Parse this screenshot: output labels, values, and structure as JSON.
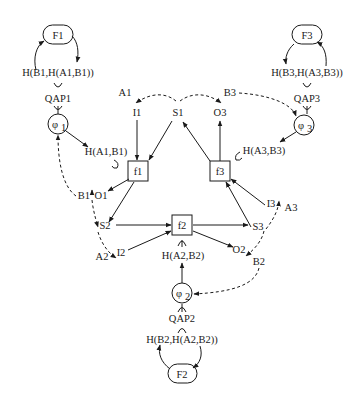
{
  "diagram": {
    "type": "cyclic-agent-interaction-network",
    "colors": {
      "ink": "#1a1a1a",
      "background": "#ffffff"
    },
    "functions": [
      {
        "id": "F1",
        "label": "F1"
      },
      {
        "id": "F2",
        "label": "F2"
      },
      {
        "id": "F3",
        "label": "F3"
      }
    ],
    "hashes": [
      {
        "id": "HB1",
        "label": "H(B1,H(A1,B1))"
      },
      {
        "id": "HB2",
        "label": "H(B2,H(A2,B2))"
      },
      {
        "id": "HB3",
        "label": "H(B3,H(A3,B3))"
      },
      {
        "id": "HA1",
        "label": "H(A1,B1)"
      },
      {
        "id": "HA2",
        "label": "H(A2,B2)"
      },
      {
        "id": "HA3",
        "label": "H(A3,B3)"
      }
    ],
    "qaps": [
      {
        "id": "QAP1",
        "label": "QAP1"
      },
      {
        "id": "QAP2",
        "label": "QAP2"
      },
      {
        "id": "QAP3",
        "label": "QAP3"
      }
    ],
    "phis": [
      {
        "id": "phi1",
        "symbol": "φ",
        "sub": "1"
      },
      {
        "id": "phi2",
        "symbol": "φ",
        "sub": "2"
      },
      {
        "id": "phi3",
        "symbol": "φ",
        "sub": "3"
      }
    ],
    "boxes": [
      {
        "id": "f1",
        "label": "f1"
      },
      {
        "id": "f2",
        "label": "f2"
      },
      {
        "id": "f3",
        "label": "f3"
      }
    ],
    "io": {
      "I1": "I1",
      "S1": "S1",
      "O3": "O3",
      "O1": "O1",
      "S2": "S2",
      "I2": "I2",
      "O2": "O2",
      "S3": "S3",
      "I3": "I3"
    },
    "keys": {
      "A1": "A1",
      "B1": "B1",
      "A2": "A2",
      "B2": "B2",
      "A3": "A3",
      "B3": "B3"
    },
    "edges": [
      {
        "from": "F1",
        "to": "HB1",
        "style": "solid"
      },
      {
        "from": "HB1",
        "to": "F1",
        "style": "solid"
      },
      {
        "from": "F3",
        "to": "HB3",
        "style": "solid"
      },
      {
        "from": "HB3",
        "to": "F3",
        "style": "solid"
      },
      {
        "from": "F2",
        "to": "HB2",
        "style": "solid"
      },
      {
        "from": "HB2",
        "to": "F2",
        "style": "solid"
      },
      {
        "from": "phi1",
        "to": "HA1",
        "style": "solid"
      },
      {
        "from": "phi3",
        "to": "HA3",
        "style": "solid"
      },
      {
        "from": "phi2",
        "to": "HA2",
        "style": "solid"
      },
      {
        "from": "I1",
        "to": "f1",
        "style": "solid"
      },
      {
        "from": "S1",
        "to": "f1",
        "style": "solid"
      },
      {
        "from": "f3",
        "to": "S1",
        "style": "solid"
      },
      {
        "from": "f3",
        "to": "O3",
        "style": "solid"
      },
      {
        "from": "f1",
        "to": "O1",
        "style": "solid"
      },
      {
        "from": "f1",
        "to": "S2",
        "style": "solid"
      },
      {
        "from": "S2",
        "to": "f2",
        "style": "solid"
      },
      {
        "from": "I2",
        "to": "f2",
        "style": "solid"
      },
      {
        "from": "f2",
        "to": "S3",
        "style": "solid"
      },
      {
        "from": "f2",
        "to": "O2",
        "style": "solid"
      },
      {
        "from": "S3",
        "to": "f3",
        "style": "solid"
      },
      {
        "from": "I3",
        "to": "f3",
        "style": "solid"
      },
      {
        "from": "S1",
        "to": "I1",
        "style": "dashed"
      },
      {
        "from": "S1",
        "to": "O3",
        "style": "dashed"
      },
      {
        "from": "B3",
        "to": "phi3",
        "style": "dashed"
      },
      {
        "from": "B1",
        "to": "phi1",
        "style": "dashed"
      },
      {
        "from": "O1",
        "to": "S2",
        "style": "dashed"
      },
      {
        "from": "S2",
        "to": "I2",
        "style": "dashed"
      },
      {
        "from": "S3",
        "to": "I3",
        "style": "dashed"
      },
      {
        "from": "S3",
        "to": "O2",
        "style": "dashed"
      },
      {
        "from": "B2",
        "to": "phi2",
        "style": "dashed"
      }
    ]
  }
}
